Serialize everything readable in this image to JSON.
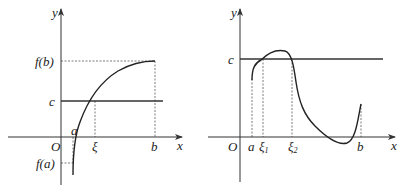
{
  "left_graph": {
    "axis_labels": {
      "x": "x",
      "y": "y",
      "origin": "O"
    },
    "y_labels": {
      "fb": "f(b)",
      "c": "c",
      "fa": "f(a)"
    },
    "x_labels": {
      "a": "a",
      "xi": "ξ",
      "b": "b"
    },
    "description": "Increasing continuous curve from f(a)<0 at x=a to f(b) at x=b, crossing horizontal line y=c at x=ξ"
  },
  "right_graph": {
    "axis_labels": {
      "x": "x",
      "y": "y",
      "origin": "O"
    },
    "y_labels": {
      "c": "c"
    },
    "x_labels": {
      "a": "a",
      "xi1": "ξ",
      "xi1_sub": "1",
      "xi2": "ξ",
      "xi2_sub": "2",
      "b": "b"
    },
    "description": "Continuous curve on [a,b] crossing horizontal line y=c at ξ1 and ξ2"
  }
}
